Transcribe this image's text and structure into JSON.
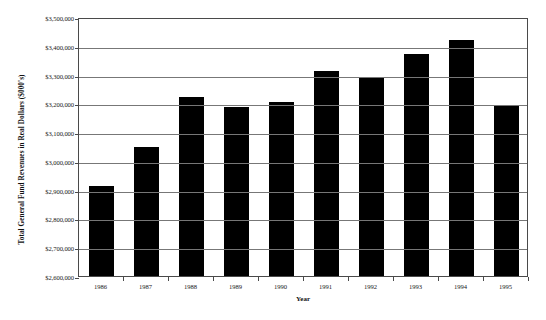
{
  "chart_data": {
    "type": "bar",
    "title": "",
    "xlabel": "Year",
    "ylabel": "Total General Fund Revenues in Real Dollars ($000's)",
    "categories": [
      "1986",
      "1987",
      "1988",
      "1989",
      "1990",
      "1991",
      "1992",
      "1993",
      "1994",
      "1995"
    ],
    "values": [
      2912000,
      3050000,
      3222000,
      3186000,
      3205000,
      3311000,
      3293000,
      3370000,
      3420000,
      3193000
    ],
    "ylim": [
      2600000,
      3500000
    ],
    "ytick_values": [
      2600000,
      2700000,
      2800000,
      2900000,
      3000000,
      3100000,
      3200000,
      3300000,
      3400000,
      3500000
    ],
    "ytick_labels": [
      "$2,600,000",
      "$2,700,000",
      "$2,800,000",
      "$2,900,000",
      "$3,000,000",
      "$3,100,000",
      "$3,200,000",
      "$3,300,000",
      "$3,400,000",
      "$3,500,000"
    ],
    "grid": true,
    "legend": null,
    "bar_color": "#000000",
    "gridline_color": "#777777",
    "axis_color": "#4a4a4a"
  }
}
